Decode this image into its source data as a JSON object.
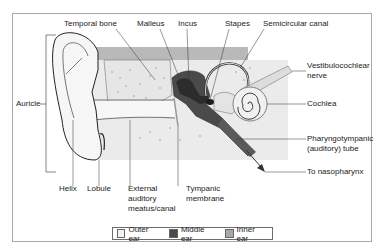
{
  "diagram": {
    "labels": {
      "temporal_bone": "Temporal bone",
      "malleus": "Malleus",
      "incus": "Incus",
      "stapes": "Stapes",
      "semicircular_canal": "Semicircular canal",
      "vestibulocochlear_nerve_line1": "Vestibulocochlear",
      "vestibulocochlear_nerve_line2": "nerve",
      "cochlea": "Cochlea",
      "pharyngotympanic_line1": "Pharyngotympanic",
      "pharyngotympanic_line2": "(auditory) tube",
      "to_nasopharynx": "To nasopharynx",
      "auricle": "Auricle",
      "helix": "Helix",
      "lobule": "Lobule",
      "external_line1": "External",
      "external_line2": "auditory",
      "external_line3": "meatus/canal",
      "tympanic_line1": "Tympanic",
      "tympanic_line2": "membrane"
    },
    "legend": [
      {
        "label": "Outer ear",
        "color": "#f2f2f2"
      },
      {
        "label": "Middle ear",
        "color": "#4a4a4a"
      },
      {
        "label": "Inner ear",
        "color": "#a8a8a8"
      }
    ]
  }
}
